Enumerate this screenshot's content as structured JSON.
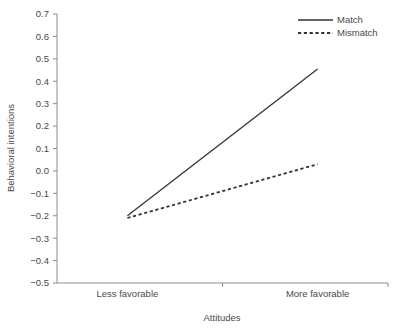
{
  "chart_data": {
    "type": "line",
    "title": "",
    "xlabel": "Attitudes",
    "ylabel": "Behavioral intentions",
    "categories": [
      "Less favorable",
      "More favorable"
    ],
    "x": [
      0,
      1
    ],
    "xlim": [
      -0.37,
      1.37
    ],
    "ylim": [
      -0.5,
      0.7
    ],
    "ytick_labels": [
      "0.7",
      "0.6",
      "0.5",
      "0.4",
      "0.3",
      "0.2",
      "0.1",
      "0.0",
      "−0.1",
      "−0.2",
      "−0.3",
      "−0.4",
      "−0.5"
    ],
    "ytick_values": [
      0.7,
      0.6,
      0.5,
      0.4,
      0.3,
      0.2,
      0.1,
      0.0,
      -0.1,
      -0.2,
      -0.3,
      -0.4,
      -0.5
    ],
    "grid": false,
    "legend_position": "top-right",
    "series": [
      {
        "name": "Match",
        "style": "solid",
        "color": "#333333",
        "values": [
          -0.2,
          0.455
        ]
      },
      {
        "name": "Mismatch",
        "style": "dashed",
        "color": "#333333",
        "values": [
          -0.21,
          0.03
        ]
      }
    ]
  },
  "axes": {
    "y_title": "Behavioral intentions",
    "x_title": "Attitudes",
    "axis_color": "#8c8c8c"
  },
  "legend": {
    "entries": [
      {
        "label": "Match",
        "style": "solid"
      },
      {
        "label": "Mismatch",
        "style": "dashed"
      }
    ]
  }
}
